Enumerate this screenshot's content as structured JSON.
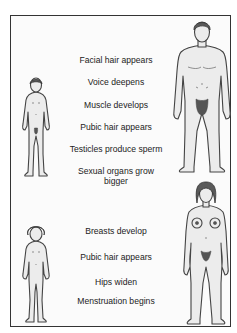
{
  "diagram": {
    "sections": [
      {
        "id": "male",
        "figures": [
          "boy-figure",
          "man-figure"
        ],
        "changes": [
          "Facial hair appears",
          "Voice deepens",
          "Muscle develops",
          "Pubic hair appears",
          "Testicles produce sperm",
          "Sexual organs grow bigger"
        ]
      },
      {
        "id": "female",
        "figures": [
          "girl-figure",
          "woman-figure"
        ],
        "changes": [
          "Breasts develop",
          "Pubic hair appears",
          "Hips widen",
          "Menstruation begins"
        ]
      }
    ],
    "colors": {
      "background": "#ffffff",
      "frame": "#333333",
      "skin": "#ececec",
      "outline": "#444444",
      "text": "#222222"
    }
  },
  "male": {
    "c0": "Facial hair appears",
    "c1": "Voice deepens",
    "c2": "Muscle develops",
    "c3": "Pubic hair appears",
    "c4": "Testicles produce sperm",
    "c5": "Sexual organs grow bigger"
  },
  "female": {
    "c0": "Breasts develop",
    "c1": "Pubic hair appears",
    "c2": "Hips widen",
    "c3": "Menstruation begins"
  }
}
